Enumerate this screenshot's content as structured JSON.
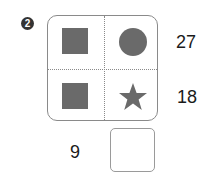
{
  "problem": {
    "number": "2",
    "cells": [
      {
        "position": "top-left",
        "shape": "square"
      },
      {
        "position": "top-right",
        "shape": "circle"
      },
      {
        "position": "bottom-left",
        "shape": "square"
      },
      {
        "position": "bottom-right",
        "shape": "star"
      }
    ],
    "row_totals": [
      "27",
      "18"
    ],
    "column_totals": [
      "9",
      ""
    ],
    "shape_color": "#6a6a6a"
  }
}
